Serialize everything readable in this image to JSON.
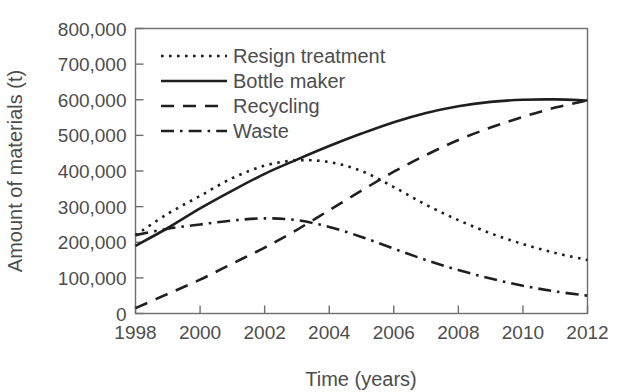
{
  "chart_data": {
    "type": "line",
    "title": "",
    "xlabel": "Time (years)",
    "ylabel": "Amount of materials (t)",
    "xlim": [
      1998,
      2012
    ],
    "ylim": [
      0,
      800000
    ],
    "xticks": [
      1998,
      2000,
      2002,
      2004,
      2006,
      2008,
      2010,
      2012
    ],
    "xtick_labels": [
      "1998",
      "2000",
      "2002",
      "2004",
      "2006",
      "2008",
      "2010",
      "2012"
    ],
    "yticks": [
      0,
      100000,
      200000,
      300000,
      400000,
      500000,
      600000,
      700000,
      800000
    ],
    "ytick_labels": [
      "0",
      "100,000",
      "200,000",
      "300,000",
      "400,000",
      "500,000",
      "600,000",
      "700,000",
      "800,000"
    ],
    "grid": false,
    "legend_position": "upper-left-inside",
    "x": [
      1998,
      1999,
      2000,
      2001,
      2002,
      2003,
      2004,
      2005,
      2006,
      2007,
      2008,
      2009,
      2010,
      2011,
      2012
    ],
    "series": [
      {
        "name": "Resign treatment",
        "style": "dotted",
        "color": "#1f1f1f",
        "values": [
          220000,
          280000,
          330000,
          380000,
          415000,
          430000,
          425000,
          400000,
          355000,
          305000,
          262000,
          225000,
          195000,
          170000,
          150000
        ]
      },
      {
        "name": "Bottle maker",
        "style": "solid",
        "color": "#1f1f1f",
        "values": [
          190000,
          240000,
          295000,
          345000,
          392000,
          432000,
          470000,
          505000,
          537000,
          563000,
          582000,
          594000,
          600000,
          601000,
          598000
        ]
      },
      {
        "name": "Recycling",
        "style": "dashed",
        "color": "#1f1f1f",
        "values": [
          15000,
          55000,
          95000,
          140000,
          185000,
          235000,
          290000,
          345000,
          398000,
          445000,
          487000,
          522000,
          552000,
          578000,
          598000
        ]
      },
      {
        "name": "Waste",
        "style": "dashdot",
        "color": "#1f1f1f",
        "values": [
          220000,
          238000,
          250000,
          261000,
          267000,
          262000,
          243000,
          215000,
          182000,
          150000,
          122000,
          98000,
          78000,
          62000,
          50000
        ]
      }
    ]
  },
  "legend": {
    "items": [
      {
        "label": "Resign treatment",
        "style": "dotted"
      },
      {
        "label": "Bottle maker",
        "style": "solid"
      },
      {
        "label": "Recycling",
        "style": "dashed"
      },
      {
        "label": "Waste",
        "style": "dashdot"
      }
    ]
  },
  "colors": {
    "ink": "#1f1f1f",
    "axis": "#6e6e6e",
    "text": "#4d4d4d",
    "background": "#ffffff"
  }
}
